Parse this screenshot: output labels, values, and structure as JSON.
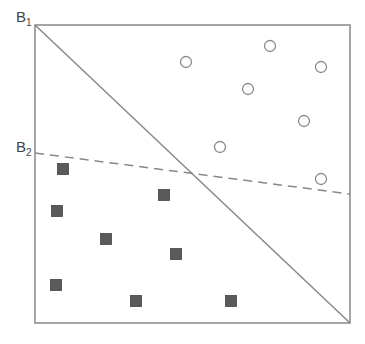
{
  "diagram": {
    "title": "",
    "labels": {
      "b1": {
        "main": "B",
        "sub": "1"
      },
      "b2": {
        "main": "B",
        "sub": "2"
      }
    },
    "frame": {
      "x1": 35,
      "y1": 25,
      "x2": 350,
      "y2": 323
    },
    "boundaries": [
      {
        "name": "B1",
        "style": "solid",
        "x1": 35,
        "y1": 25,
        "x2": 350,
        "y2": 323
      },
      {
        "name": "B2",
        "style": "dashed",
        "x1": 35,
        "y1": 153,
        "x2": 350,
        "y2": 194
      }
    ],
    "circles": [
      [
        186,
        62
      ],
      [
        270,
        46
      ],
      [
        321,
        67
      ],
      [
        248,
        89
      ],
      [
        304,
        121
      ],
      [
        220,
        147
      ],
      [
        321,
        179
      ]
    ],
    "squares": [
      [
        63,
        169
      ],
      [
        57,
        211
      ],
      [
        164,
        195
      ],
      [
        106,
        239
      ],
      [
        176,
        254
      ],
      [
        56,
        285
      ],
      [
        136,
        301
      ],
      [
        231,
        301
      ]
    ],
    "colors": {
      "line": "#888888",
      "square_fill": "#5a5a5a",
      "circle_stroke": "#8a8a8a"
    },
    "caption": ""
  }
}
